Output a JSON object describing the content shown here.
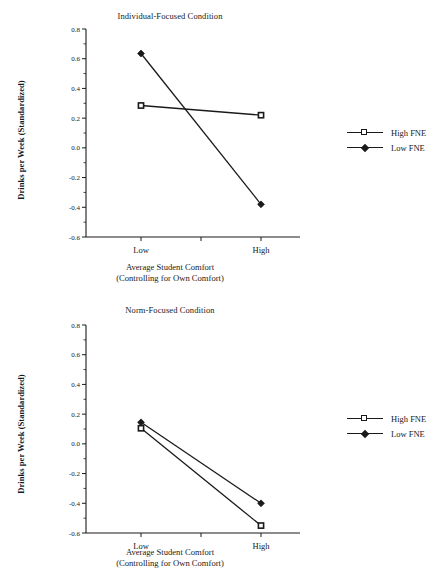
{
  "figure": {
    "ylabel": "Drinks per Week (Standardized)",
    "xlabel_line1": "Average Student Comfort",
    "xlabel_line2": "(Controlling for Own Comfort)",
    "yticks": [
      "0.8",
      "0.6",
      "0.4",
      "0.2",
      "0.0",
      "-0.2",
      "-0.4",
      "-0.6"
    ],
    "xticks": [
      "Low",
      "High"
    ],
    "legend": {
      "high_fne": "High FNE",
      "low_fne": "Low FNE"
    },
    "line_color": "#1a1a1a"
  },
  "chart_data": [
    {
      "type": "line",
      "title": "Individual-Focused Condition",
      "xlabel": "Average Student Comfort (Controlling for Own Comfort)",
      "ylabel": "Drinks per Week (Standardized)",
      "categories": [
        "Low",
        "High"
      ],
      "ylim": [
        -0.6,
        0.8
      ],
      "ytick_values": [
        0.8,
        0.6,
        0.4,
        0.2,
        0.0,
        -0.2,
        -0.4,
        -0.6
      ],
      "grid": false,
      "legend_position": "right",
      "series": [
        {
          "name": "High FNE",
          "marker": "square",
          "values": [
            0.285,
            0.22
          ]
        },
        {
          "name": "Low FNE",
          "marker": "diamond",
          "values": [
            0.635,
            -0.38
          ]
        }
      ]
    },
    {
      "type": "line",
      "title": "Norm-Focused Condition",
      "xlabel": "Average Student Comfort (Controlling for Own Comfort)",
      "ylabel": "Drinks per Week (Standardized)",
      "categories": [
        "Low",
        "High"
      ],
      "ylim": [
        -0.6,
        0.8
      ],
      "ytick_values": [
        0.8,
        0.6,
        0.4,
        0.2,
        0.0,
        -0.2,
        -0.4,
        -0.6
      ],
      "grid": false,
      "legend_position": "right",
      "series": [
        {
          "name": "High FNE",
          "marker": "square",
          "values": [
            0.105,
            -0.55
          ]
        },
        {
          "name": "Low FNE",
          "marker": "diamond",
          "values": [
            0.145,
            -0.4
          ]
        }
      ]
    }
  ]
}
